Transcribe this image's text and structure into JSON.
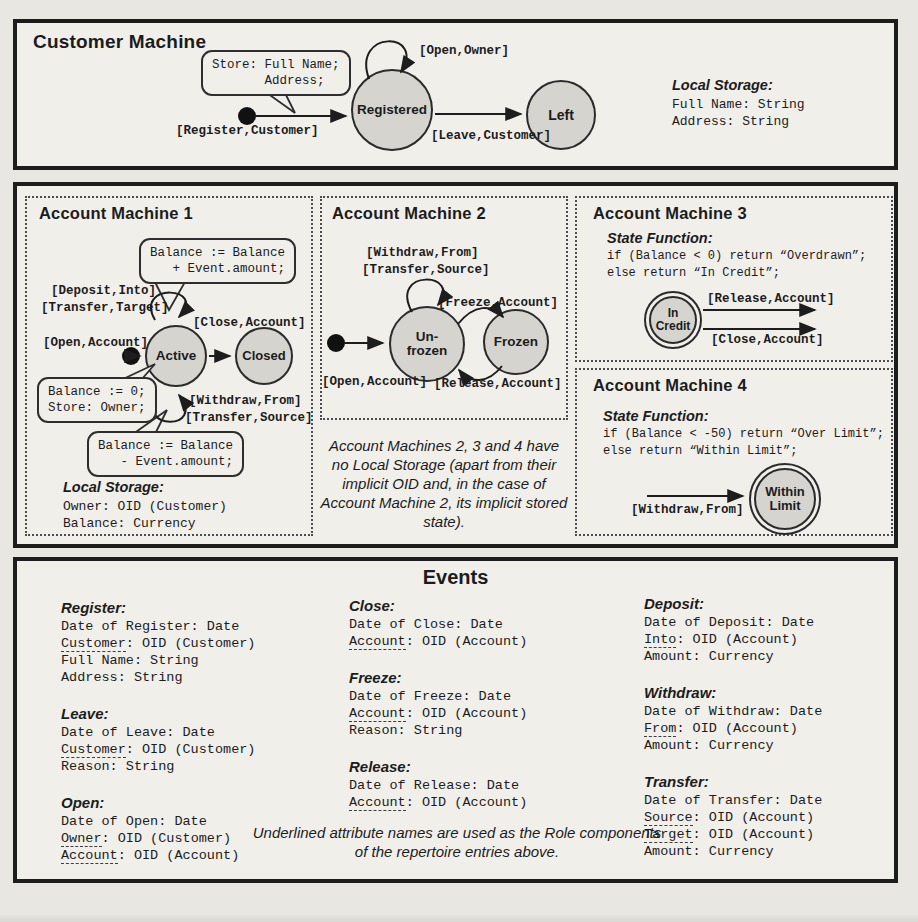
{
  "colors": {
    "paper": "#e9e7e2",
    "panel_bg": "#f1efea",
    "ink": "#1d1d1d",
    "state_fill": "#d6d4cf"
  },
  "customer_machine": {
    "title": "Customer Machine",
    "store_bubble": "Store: Full Name;\n       Address;",
    "register_label": "[Register,Customer]",
    "open_owner_label": "[Open,Owner]",
    "leave_label": "[Leave,Customer]",
    "state_registered": "Registered",
    "state_left": "Left",
    "local_storage_title": "Local Storage:",
    "local_storage_lines": "Full Name: String\nAddress: String"
  },
  "account_machine_1": {
    "title": "Account Machine 1",
    "bubble_plus": "Balance := Balance\n   + Event.amount;",
    "deposit_label": "[Deposit,Into]",
    "transfer_target_label": "[Transfer,Target]",
    "close_label": "[Close,Account]",
    "open_label": "[Open,Account]",
    "state_active": "Active",
    "state_closed": "Closed",
    "bubble_init": "Balance := 0;\nStore: Owner;",
    "withdraw_label": "[Withdraw,From]",
    "transfer_source_label": "[Transfer,Source]",
    "bubble_minus": "Balance := Balance\n   - Event.amount;",
    "local_storage_title": "Local Storage:",
    "local_storage_lines": "Owner: OID (Customer)\nBalance: Currency"
  },
  "account_machine_2": {
    "title": "Account Machine 2",
    "withdraw_label": "[Withdraw,From]",
    "transfer_source_label": "[Transfer,Source]",
    "freeze_label": "[Freeze,Account]",
    "state_unfrozen": "Un-\nfrozen",
    "state_frozen": "Frozen",
    "open_label": "[Open,Account]",
    "release_label": "[Release,Account]"
  },
  "machines_note": "Account Machines 2, 3 and 4 have no Local Storage (apart from their implicit OID and, in the case of Account Machine 2, its implicit stored state).",
  "account_machine_3": {
    "title": "Account Machine 3",
    "state_function_title": "State Function:",
    "code": "if (Balance < 0) return “Overdrawn”;\nelse return “In Credit”;",
    "state_in_credit": "In\nCredit",
    "release_label": "[Release,Account]",
    "close_label": "[Close,Account]"
  },
  "account_machine_4": {
    "title": "Account Machine 4",
    "state_function_title": "State Function:",
    "code": "if (Balance < -50) return “Over Limit”;\nelse return “Within Limit”;",
    "withdraw_label": "[Withdraw,From]",
    "state_within_limit": "Within\nLimit"
  },
  "events": {
    "title": "Events",
    "note": "Underlined attribute names are used as the Role components of the repertoire entries above.",
    "col1": [
      {
        "name": "Register:",
        "lines": [
          {
            "pre": "Date of Register: Date"
          },
          {
            "u": "Customer",
            "post": ": OID (Customer)"
          },
          {
            "pre": "Full Name: String"
          },
          {
            "pre": "Address: String"
          }
        ]
      },
      {
        "name": "Leave:",
        "lines": [
          {
            "pre": "Date of Leave: Date"
          },
          {
            "u": "Customer",
            "post": ": OID (Customer)"
          },
          {
            "pre": "Reason: String"
          }
        ]
      },
      {
        "name": "Open:",
        "lines": [
          {
            "pre": "Date of Open: Date"
          },
          {
            "u": "Owner",
            "post": ": OID (Customer)"
          },
          {
            "u": "Account",
            "post": ": OID (Account)"
          }
        ]
      }
    ],
    "col2": [
      {
        "name": "Close:",
        "lines": [
          {
            "pre": "Date of Close: Date"
          },
          {
            "u": "Account",
            "post": ": OID (Account)"
          }
        ]
      },
      {
        "name": "Freeze:",
        "lines": [
          {
            "pre": "Date of Freeze: Date"
          },
          {
            "u": "Account",
            "post": ": OID (Account)"
          },
          {
            "pre": "Reason: String"
          }
        ]
      },
      {
        "name": "Release:",
        "lines": [
          {
            "pre": "Date of Release: Date"
          },
          {
            "u": "Account",
            "post": ": OID (Account)"
          }
        ]
      }
    ],
    "col3": [
      {
        "name": "Deposit:",
        "lines": [
          {
            "pre": "Date of Deposit: Date"
          },
          {
            "u": "Into",
            "post": ": OID (Account)"
          },
          {
            "pre": "Amount: Currency"
          }
        ]
      },
      {
        "name": "Withdraw:",
        "lines": [
          {
            "pre": "Date of Withdraw: Date"
          },
          {
            "u": "From",
            "post": ": OID (Account)"
          },
          {
            "pre": "Amount: Currency"
          }
        ]
      },
      {
        "name": "Transfer:",
        "lines": [
          {
            "pre": "Date of Transfer: Date"
          },
          {
            "u": "Source",
            "post": ": OID (Account)"
          },
          {
            "u": "Target",
            "post": ": OID (Account)"
          },
          {
            "pre": "Amount: Currency"
          }
        ]
      }
    ]
  }
}
